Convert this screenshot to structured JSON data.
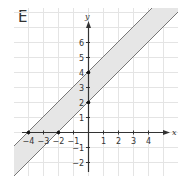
{
  "panel_label": "E",
  "chart_data": {
    "type": "line",
    "title": "E",
    "xlabel": "x",
    "ylabel": "y",
    "xlim": [
      -5,
      5.5
    ],
    "ylim": [
      -3,
      7
    ],
    "grid": true,
    "x_ticks": [
      "-4",
      "-3",
      "-2",
      "-1",
      "1",
      "2",
      "3",
      "4"
    ],
    "y_ticks": [
      "-2",
      "-1",
      "1",
      "2",
      "3",
      "4",
      "5",
      "6"
    ],
    "series": [
      {
        "name": "upper boundary",
        "equation": "y = x + 4",
        "points": [
          [
            -4,
            0
          ],
          [
            0,
            4
          ]
        ]
      },
      {
        "name": "lower boundary",
        "equation": "y = x + 2",
        "points": [
          [
            -2,
            0
          ],
          [
            0,
            2
          ]
        ]
      }
    ],
    "shaded_region": "between y = x + 2 and y = x + 4",
    "marked_points": [
      [
        -4,
        0
      ],
      [
        -2,
        0
      ],
      [
        0,
        2
      ],
      [
        0,
        4
      ]
    ]
  },
  "colors": {
    "shade": "#e6e6e6",
    "line": "#777777",
    "axis": "#333333",
    "grid": "#e4e4e4"
  }
}
